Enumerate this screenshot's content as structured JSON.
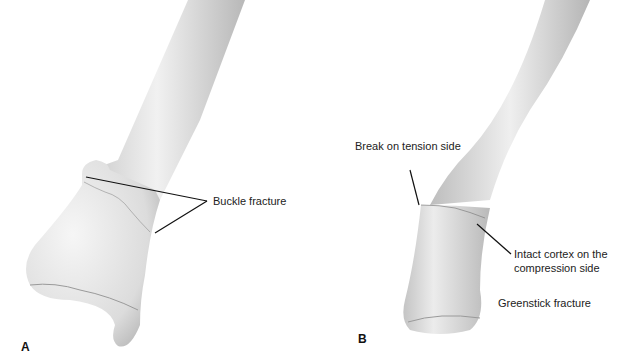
{
  "figure": {
    "panel_a": {
      "letter": "A",
      "title": "Buckle fracture",
      "labels": {
        "buckle": "Buckle fracture"
      }
    },
    "panel_b": {
      "letter": "B",
      "title": "Greenstick fracture",
      "labels": {
        "tension": "Break on tension side",
        "intact_line1": "Intact cortex on the",
        "intact_line2": "compression side",
        "greenstick": "Greenstick fracture"
      }
    },
    "colors": {
      "bone_light": "#f2f2f2",
      "bone_mid": "#d6d6d6",
      "bone_dark": "#a9a9a9",
      "leader": "#111111"
    }
  }
}
